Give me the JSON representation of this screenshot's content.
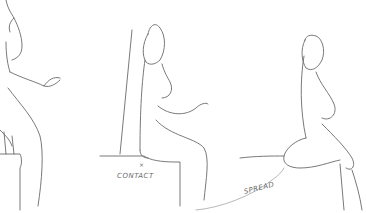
{
  "illustration": {
    "description": "Pencil sketch of three seated female figures demonstrating sitting poses",
    "figures": [
      {
        "id": "left",
        "pose": "standing/leaning on box edge"
      },
      {
        "id": "middle",
        "pose": "seated upright on box against wall"
      },
      {
        "id": "right",
        "pose": "seated on ledge with spread thigh"
      }
    ],
    "labels": {
      "contact_marker": "×",
      "contact": "CONTACT",
      "spread": "SPREAD"
    },
    "colors": {
      "background": "#ffffff",
      "stroke": "#6a6a6a"
    }
  }
}
